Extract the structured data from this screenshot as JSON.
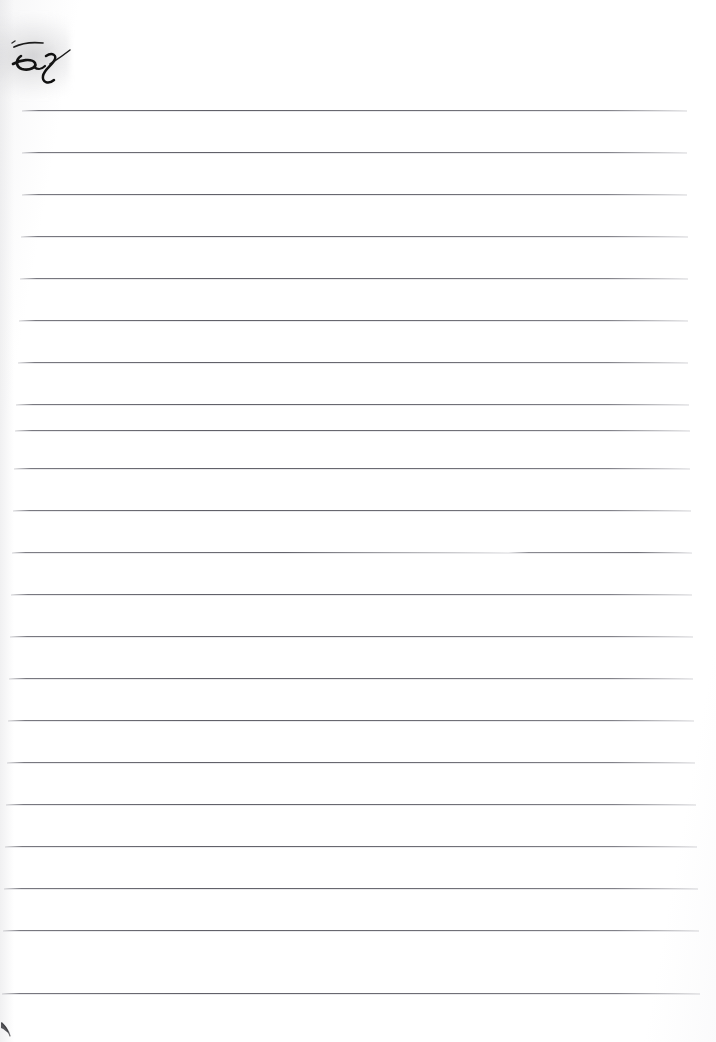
{
  "document": {
    "kind": "scanned-ruled-notebook-page",
    "page_width": 716,
    "page_height": 1042,
    "background_color": "#fefefe",
    "title_fragment": "es",
    "title_fragment_note": "partially cropped cursive handwriting at the top-left with an overbar stroke",
    "ink_color": "#1a1a1a"
  },
  "rules": {
    "count": 22,
    "color": "#646470",
    "thickness_px": 1,
    "spacing_px": 42,
    "first_y": 110,
    "last_y": 993,
    "lines": [
      {
        "y": 110,
        "x": 22,
        "width": 665,
        "gapped": false
      },
      {
        "y": 152,
        "x": 22,
        "width": 665,
        "gapped": false
      },
      {
        "y": 194,
        "x": 22,
        "width": 665,
        "gapped": false
      },
      {
        "y": 236,
        "x": 21,
        "width": 667,
        "gapped": false
      },
      {
        "y": 278,
        "x": 20,
        "width": 668,
        "gapped": false
      },
      {
        "y": 320,
        "x": 19,
        "width": 669,
        "gapped": false
      },
      {
        "y": 362,
        "x": 18,
        "width": 670,
        "gapped": false
      },
      {
        "y": 404,
        "x": 16,
        "width": 673,
        "gapped": false
      },
      {
        "y": 430,
        "x": 15,
        "width": 675,
        "gapped": false
      },
      {
        "y": 468,
        "x": 14,
        "width": 676,
        "gapped": false
      },
      {
        "y": 510,
        "x": 13,
        "width": 678,
        "gapped": false
      },
      {
        "y": 552,
        "x": 12,
        "width": 680,
        "gapped": true
      },
      {
        "y": 594,
        "x": 11,
        "width": 681,
        "gapped": false
      },
      {
        "y": 636,
        "x": 10,
        "width": 683,
        "gapped": false
      },
      {
        "y": 678,
        "x": 9,
        "width": 684,
        "gapped": false
      },
      {
        "y": 720,
        "x": 8,
        "width": 686,
        "gapped": false
      },
      {
        "y": 762,
        "x": 7,
        "width": 688,
        "gapped": false
      },
      {
        "y": 804,
        "x": 6,
        "width": 690,
        "gapped": false
      },
      {
        "y": 846,
        "x": 5,
        "width": 692,
        "gapped": false
      },
      {
        "y": 888,
        "x": 4,
        "width": 694,
        "gapped": false
      },
      {
        "y": 930,
        "x": 3,
        "width": 696,
        "gapped": false
      },
      {
        "y": 993,
        "x": 2,
        "width": 698,
        "gapped": false
      }
    ]
  },
  "marks": {
    "ink_smudge": {
      "label": "stray ink stroke",
      "x": 0,
      "y": 1020,
      "color": "#3a3a3e"
    },
    "corner_shadow": {
      "label": "page-curl shadow",
      "x": 0,
      "y": 20,
      "color": "#787880"
    }
  }
}
